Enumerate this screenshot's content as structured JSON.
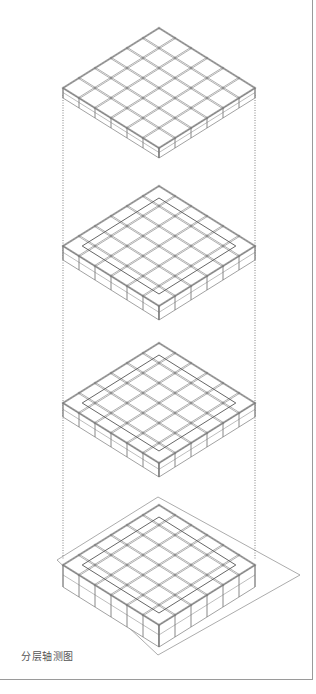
{
  "caption": "分层轴测图",
  "drawing": {
    "type": "exploded-axonometric",
    "layer_count": 4,
    "grid_divisions": 6,
    "line_color": "#7a7a7a",
    "dotted_line_color": "#666666",
    "ground_plane_color": "#888888",
    "frame_color": "#9a9a9a",
    "layers": [
      {
        "name": "layer-1-top",
        "cx": 159,
        "top": 28,
        "left_x": 63,
        "right_x": 255,
        "mid_y": 88,
        "depth": 10
      },
      {
        "name": "layer-2",
        "cx": 159,
        "top": 186,
        "left_x": 63,
        "right_x": 255,
        "mid_y": 246,
        "depth": 14
      },
      {
        "name": "layer-3",
        "cx": 159,
        "top": 343,
        "left_x": 63,
        "right_x": 255,
        "mid_y": 403,
        "depth": 14
      },
      {
        "name": "layer-4-ground",
        "cx": 159,
        "top": 505,
        "left_x": 63,
        "right_x": 255,
        "mid_y": 565,
        "depth": 22
      }
    ],
    "ground_plane": {
      "points": [
        [
          57,
          560
        ],
        [
          158,
          497
        ],
        [
          300,
          575
        ],
        [
          158,
          655
        ]
      ]
    },
    "dotted_guides": [
      {
        "x": 63,
        "y1": 95,
        "y2": 560
      },
      {
        "x": 255,
        "y1": 95,
        "y2": 560
      }
    ]
  }
}
